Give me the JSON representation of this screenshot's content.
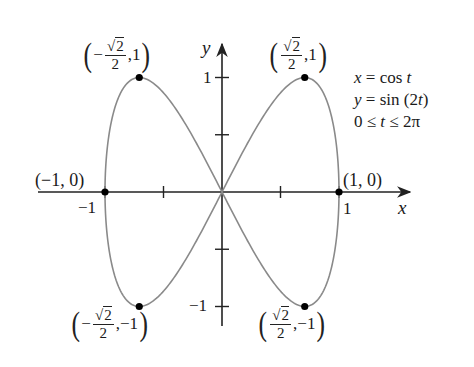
{
  "figure": {
    "colors": {
      "axis": "#222222",
      "curve": "#8a8a8a",
      "point": "#000000",
      "background": "#ffffff"
    }
  },
  "axes": {
    "x_label": "x",
    "y_label": "y",
    "x_ticks": [
      {
        "value": -1,
        "label": "−1"
      },
      {
        "value": -0.5,
        "label": ""
      },
      {
        "value": 0.5,
        "label": ""
      },
      {
        "value": 1,
        "label": "1"
      }
    ],
    "y_ticks": [
      {
        "value": 1,
        "label": "1"
      },
      {
        "value": 0.5,
        "label": ""
      },
      {
        "value": -0.5,
        "label": ""
      },
      {
        "value": -1,
        "label": "−1"
      }
    ]
  },
  "equations": {
    "line1": {
      "lhs": "x",
      "op": " = ",
      "rhs_fn": "cos ",
      "rhs_var": "t"
    },
    "line2": {
      "lhs": "y",
      "op": " = ",
      "rhs_fn": "sin (2",
      "rhs_var": "t",
      "rhs_end": ")"
    },
    "line3": {
      "a": "0 ≤ ",
      "var": "t",
      "b": " ≤ 2π"
    }
  },
  "points": {
    "top_left": {
      "sign": "− ",
      "num": "2",
      "den": "2",
      "y": "1",
      "open": "(",
      "close": ")",
      "sqrt": "√",
      "comma": ", "
    },
    "top_right": {
      "sign": "",
      "num": "2",
      "den": "2",
      "y": "1",
      "open": "(",
      "close": ")",
      "sqrt": "√",
      "comma": ", "
    },
    "bottom_left": {
      "sign": "− ",
      "num": "2",
      "den": "2",
      "y": "−1",
      "open": "(",
      "close": ")",
      "sqrt": "√",
      "comma": ", "
    },
    "bottom_right": {
      "sign": "",
      "num": "2",
      "den": "2",
      "y": "−1",
      "open": "(",
      "close": ")",
      "sqrt": "√",
      "comma": ", "
    },
    "left": {
      "text": "(−1, 0)"
    },
    "right": {
      "text": "(1, 0)"
    }
  },
  "chart_data": {
    "type": "line",
    "title": "",
    "parametric": {
      "x": "cos t",
      "y": "sin(2t)",
      "t_range": [
        0,
        6.2832
      ]
    },
    "xlabel": "x",
    "ylabel": "y",
    "xlim": [
      -1.0,
      1.0
    ],
    "ylim": [
      -1.0,
      1.0
    ],
    "grid": false,
    "highlighted_points": [
      {
        "x": -0.7071,
        "y": 1,
        "label": "(−√2/2, 1)"
      },
      {
        "x": 0.7071,
        "y": 1,
        "label": "(√2/2, 1)"
      },
      {
        "x": -1,
        "y": 0,
        "label": "(−1, 0)"
      },
      {
        "x": 1,
        "y": 0,
        "label": "(1, 0)"
      },
      {
        "x": -0.7071,
        "y": -1,
        "label": "(−√2/2, −1)"
      },
      {
        "x": 0.7071,
        "y": -1,
        "label": "(√2/2, −1)"
      }
    ]
  }
}
